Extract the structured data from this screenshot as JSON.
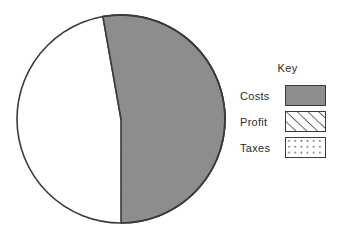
{
  "chart_data": {
    "type": "pie",
    "title": "",
    "legend_title": "Key",
    "legend_position": "right",
    "categories": [
      "Costs",
      "Profit",
      "Taxes"
    ],
    "values": [
      53,
      21,
      26
    ],
    "unit": "percent",
    "slices": [
      {
        "label": "Costs",
        "value": 53,
        "start_angle_deg": 350,
        "end_angle_deg": 180,
        "sweep_deg": 190,
        "fill_style": "solid",
        "fill_color": "#8d8d8d",
        "stroke_color": "#3a3a3a"
      },
      {
        "label": "Profit",
        "value": 21,
        "start_angle_deg": 350,
        "end_angle_deg": 65,
        "sweep_deg": 75,
        "fill_style": "diagonal-hatch",
        "fill_color": "#ffffff",
        "pattern_color": "#3a3a3a",
        "stroke_color": "#3a3a3a"
      },
      {
        "label": "Taxes",
        "value": 26,
        "start_angle_deg": 65,
        "end_angle_deg": 180,
        "sweep_deg": 95,
        "fill_style": "dots",
        "fill_color": "#ffffff",
        "pattern_color": "#3a3a3a",
        "stroke_color": "#3a3a3a"
      }
    ],
    "geometry": {
      "center_x": 121,
      "center_y": 119,
      "radius": 104
    },
    "xlabel": "",
    "ylabel": "",
    "grid": false
  },
  "legend": {
    "title": "Key",
    "items": [
      {
        "label": "Costs",
        "swatch": "solid-gray-swatch"
      },
      {
        "label": "Profit",
        "swatch": "diagonal-hatch-swatch"
      },
      {
        "label": "Taxes",
        "swatch": "dotted-swatch"
      }
    ]
  },
  "colors": {
    "background": "#ffffff",
    "outline": "#3a3a3a",
    "gray_fill": "#8d8d8d",
    "text": "#2b2b2b"
  }
}
